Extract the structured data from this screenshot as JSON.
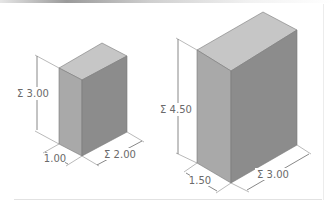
{
  "diagram": {
    "type": "isometric-dimensioned-boxes",
    "colors": {
      "top_face": "#c6c6c6",
      "left_face": "#a9a9a9",
      "right_face": "#8c8c8c",
      "dimension_line": "#6a6a6a",
      "label_text": "#6a6a6a"
    },
    "boxes": [
      {
        "name": "small-box",
        "dimensions": {
          "height": {
            "label": "Σ 3.00",
            "value": 3.0
          },
          "depth": {
            "label": "1.00",
            "value": 1.0
          },
          "width": {
            "label": "Σ 2.00",
            "value": 2.0
          }
        }
      },
      {
        "name": "large-box",
        "dimensions": {
          "height": {
            "label": "Σ 4.50",
            "value": 4.5
          },
          "depth": {
            "label": "1.50",
            "value": 1.5
          },
          "width": {
            "label": "Σ 3.00",
            "value": 3.0
          }
        }
      }
    ]
  }
}
